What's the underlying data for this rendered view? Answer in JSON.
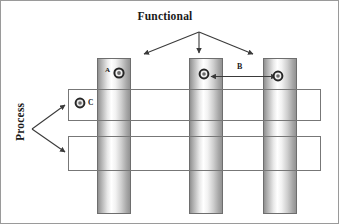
{
  "diagram": {
    "title": "Functional",
    "axis_label_vertical": "Process",
    "markers": {
      "a": "A",
      "b": "B",
      "c": "C"
    },
    "colors": {
      "line": "#555555",
      "text": "#1a1a1a",
      "column_edge": "#8e8e8e",
      "column_highlight": "#ffffff",
      "column_border": "#6e6e6e",
      "bar_fill": "#ffffff",
      "bar_border": "#777777",
      "marker_ring": "#2b2b2b",
      "marker_center": "#6a6a6a"
    },
    "columns": [
      {
        "name": "functional-column-1",
        "x": 96,
        "width": 34
      },
      {
        "name": "functional-column-2",
        "x": 188,
        "width": 34
      },
      {
        "name": "functional-column-3",
        "x": 262,
        "width": 34
      }
    ],
    "bars": [
      {
        "name": "process-bar-upper",
        "y": 88,
        "height": 32
      },
      {
        "name": "process-bar-lower",
        "y": 135,
        "height": 35
      }
    ],
    "arrows": {
      "functional_fan_count": 3,
      "process_fan_count": 2,
      "measure_b_double_headed": true
    }
  }
}
